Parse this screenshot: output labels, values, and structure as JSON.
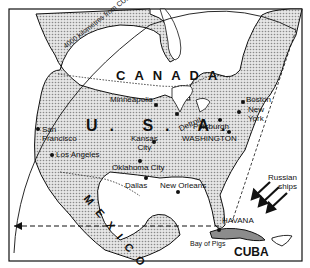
{
  "map": {
    "title": "Cuban missile range",
    "range_arc_label": "4000 kilometres from CUBA",
    "countries": [
      {
        "name": "CANADA"
      },
      {
        "name": "U. S. A."
      },
      {
        "name": "MEXICO"
      },
      {
        "name": "CUBA"
      }
    ],
    "cities": [
      {
        "name": "Minneapolis"
      },
      {
        "name": "San Francisco",
        "line1": "San",
        "line2": "Francisco"
      },
      {
        "name": "Los Angeles"
      },
      {
        "name": "Kansas City",
        "line1": "Kansas",
        "line2": "City"
      },
      {
        "name": "Oklahoma City"
      },
      {
        "name": "Dallas"
      },
      {
        "name": "New Orleans"
      },
      {
        "name": "Detroit"
      },
      {
        "name": "Pittsburgh"
      },
      {
        "name": "WASHINGTON"
      },
      {
        "name": "Boston"
      },
      {
        "name": "New York",
        "line1": "New",
        "line2": "York"
      },
      {
        "name": "HAVANA"
      },
      {
        "name": "Bay of Pigs"
      }
    ],
    "annotations": {
      "russian_ships_line1": "Russian",
      "russian_ships_line2": "ships"
    },
    "colors": {
      "land_shade": "#bdbdbd",
      "ink": "#111111",
      "background": "#ffffff"
    }
  }
}
